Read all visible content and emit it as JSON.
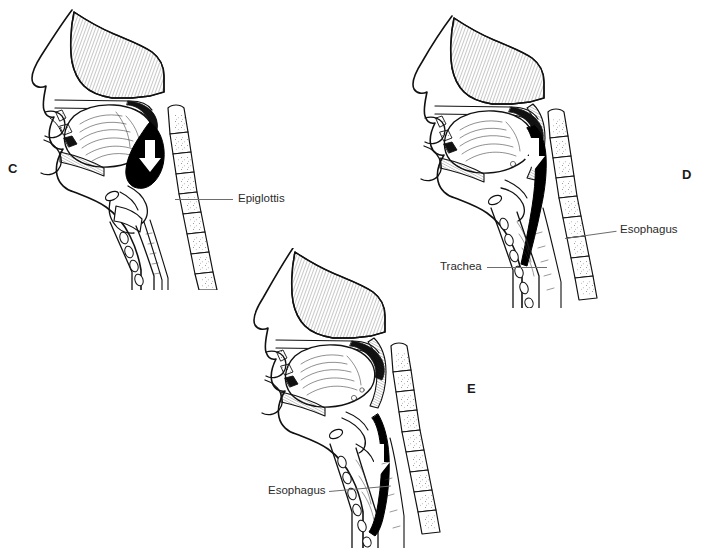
{
  "figure": {
    "background_color": "#ffffff",
    "line_color": "#111111",
    "bolus_color": "#000000",
    "label_color": "#2b2b2b",
    "leader_color": "#6d6d6d"
  },
  "panels": [
    {
      "id": "panel-c",
      "letter": "C",
      "letter_x": 8,
      "letter_y": 162,
      "description": "Pharyngeal stage: bolus passes the epiglottis",
      "labels": [
        {
          "name": "epiglottis",
          "text": "Epiglottis",
          "text_x": 238,
          "text_y": 193,
          "leader_x": 175,
          "leader_y": 199,
          "leader_width": 58
        }
      ]
    },
    {
      "id": "panel-d",
      "letter": "D",
      "letter_x": 682,
      "letter_y": 168,
      "description": "Bolus enters the esophagus; trachea is protected",
      "labels": [
        {
          "name": "esophagus",
          "text": "Esophagus",
          "text_x": 620,
          "text_y": 224,
          "leader_x": 565,
          "leader_y": 238,
          "leader_width": 52
        },
        {
          "name": "trachea",
          "text": "Trachea",
          "text_x": 440,
          "text_y": 261,
          "leader_x": 487,
          "leader_y": 267,
          "leader_width": 60
        }
      ]
    },
    {
      "id": "panel-e",
      "letter": "E",
      "letter_x": 467,
      "letter_y": 382,
      "description": "Esophageal stage: peristalsis moves bolus down the esophagus",
      "labels": [
        {
          "name": "esophagus",
          "text": "Esophagus",
          "text_x": 268,
          "text_y": 485,
          "leader_x": 329,
          "leader_y": 491,
          "leader_width": 62
        }
      ]
    }
  ]
}
